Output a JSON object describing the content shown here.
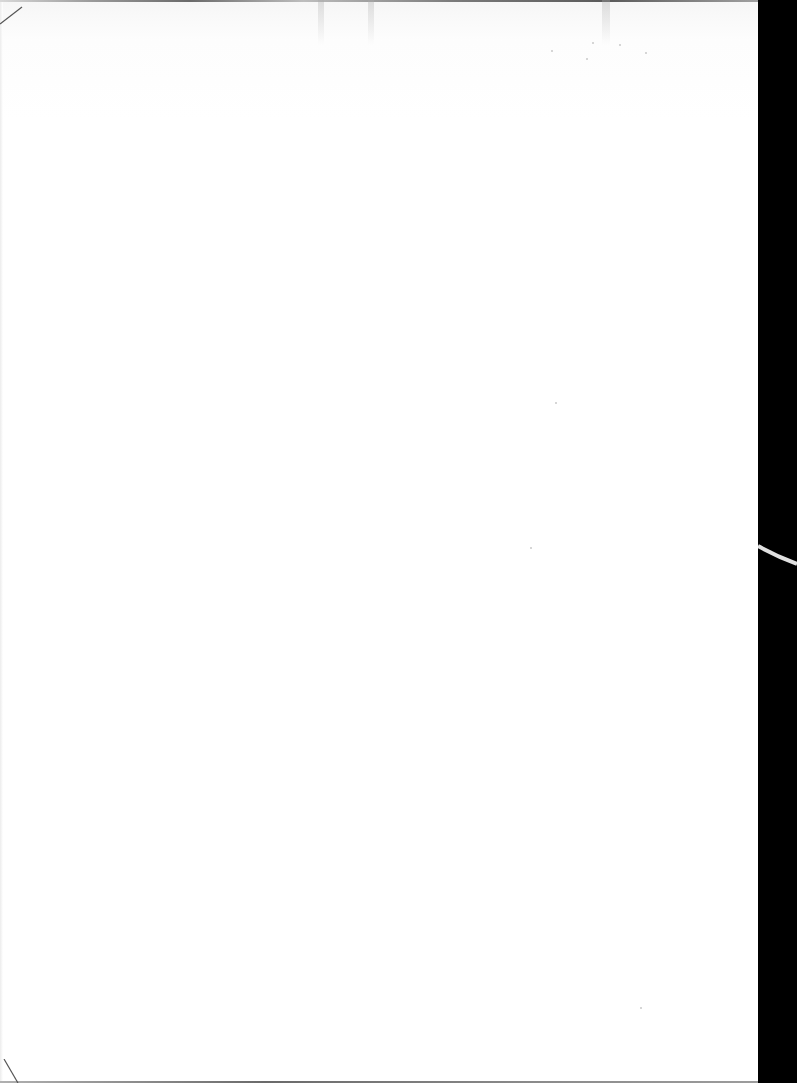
{
  "page": {
    "type": "blank scanned page",
    "text_content": "",
    "colors": {
      "paper": "#ffffff",
      "scan_border": "#000000",
      "edge_shadow": "#6a6a6a"
    }
  }
}
